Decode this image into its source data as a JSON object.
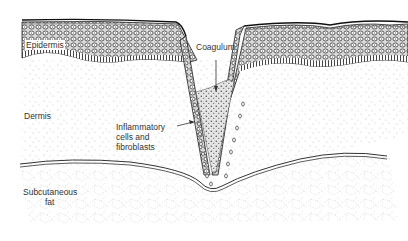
{
  "diagram": {
    "labels": {
      "epidermis": "Epidermis",
      "dermis": "Dermis",
      "subcutaneous_line1": "Subcutaneous",
      "subcutaneous_line2": "fat",
      "coagulum": "Coagulum",
      "inflammatory_line1": "Inflammatory",
      "inflammatory_line2": "cells and",
      "inflammatory_line3": "fibroblasts"
    },
    "colors": {
      "ink": "#222222",
      "background": "#ffffff",
      "stipple": "#b0b0b0"
    }
  }
}
